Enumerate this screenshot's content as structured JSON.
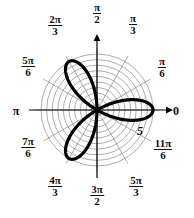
{
  "figure": {
    "type": "polar-plot",
    "title": "",
    "background": "#ffffff",
    "curve_color": "#000000",
    "grid_color": "#8a8a8a",
    "axis_color": "#000000"
  },
  "polar_grid": {
    "center_x": 97,
    "center_y": 110,
    "outer_radius_px": 56,
    "ring_count": 10,
    "spoke_count": 12,
    "spoke_step_degrees": 30,
    "radial_scale_label": "5",
    "radial_max": 5
  },
  "angle_labels": [
    {
      "name": "angle-0",
      "text": "0",
      "kind": "plain",
      "degrees": 0,
      "x": 176,
      "y": 110
    },
    {
      "name": "angle-pi-6",
      "num": "π",
      "den": "6",
      "kind": "frac",
      "degrees": 30,
      "x": 162,
      "y": 68
    },
    {
      "name": "angle-pi-3",
      "num": "π",
      "den": "3",
      "kind": "frac",
      "degrees": 60,
      "x": 133,
      "y": 25
    },
    {
      "name": "angle-pi-2",
      "num": "π",
      "den": "2",
      "kind": "frac",
      "degrees": 90,
      "x": 97,
      "y": 14
    },
    {
      "name": "angle-2pi-3",
      "num": "2π",
      "den": "3",
      "kind": "frac",
      "degrees": 120,
      "x": 55,
      "y": 26
    },
    {
      "name": "angle-5pi-6",
      "num": "5π",
      "den": "6",
      "kind": "frac",
      "degrees": 150,
      "x": 28,
      "y": 67
    },
    {
      "name": "angle-pi",
      "text": "π",
      "kind": "plain",
      "degrees": 180,
      "x": 16,
      "y": 110
    },
    {
      "name": "angle-7pi-6",
      "num": "7π",
      "den": "6",
      "kind": "frac",
      "degrees": 210,
      "x": 28,
      "y": 148
    },
    {
      "name": "angle-4pi-3",
      "num": "4π",
      "den": "3",
      "kind": "frac",
      "degrees": 240,
      "x": 55,
      "y": 187
    },
    {
      "name": "angle-3pi-2",
      "num": "3π",
      "den": "2",
      "kind": "frac",
      "degrees": 270,
      "x": 97,
      "y": 196
    },
    {
      "name": "angle-5pi-3",
      "num": "5π",
      "den": "3",
      "kind": "frac",
      "degrees": 300,
      "x": 136,
      "y": 187
    },
    {
      "name": "angle-11pi-6",
      "num": "11π",
      "den": "6",
      "kind": "frac",
      "degrees": 330,
      "x": 163,
      "y": 150
    }
  ],
  "scale_marker": {
    "name": "radial-scale-5",
    "text": "5",
    "x": 140,
    "y": 131
  },
  "chart_data": {
    "type": "line",
    "subtype": "polar-rose",
    "title": "",
    "equation": "r = 5 cos(3θ)",
    "petal_count": 3,
    "amplitude": 5,
    "k": 3,
    "theta_range_degrees": [
      0,
      360
    ],
    "rlim": [
      0,
      5
    ],
    "rticks": [
      5
    ],
    "theta_ticks_degrees": [
      0,
      30,
      60,
      90,
      120,
      150,
      180,
      210,
      240,
      270,
      300,
      330
    ],
    "theta_tick_labels": [
      "0",
      "π/6",
      "π/3",
      "π/2",
      "2π/3",
      "5π/6",
      "π",
      "7π/6",
      "4π/3",
      "3π/2",
      "5π/3",
      "11π/6"
    ],
    "petal_tip_angles_degrees": [
      0,
      120,
      240
    ],
    "grid": true,
    "legend": false,
    "xlabel": "",
    "ylabel": ""
  }
}
